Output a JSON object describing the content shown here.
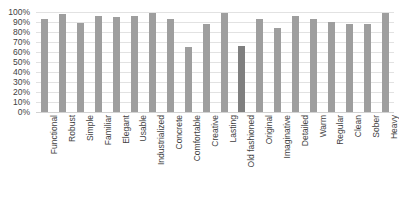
{
  "chart_data": {
    "type": "bar",
    "title": "",
    "xlabel": "",
    "ylabel": "",
    "ylim": [
      0,
      100
    ],
    "ytick_labels": [
      "100%",
      "90%",
      "80%",
      "70%",
      "60%",
      "50%",
      "40%",
      "30%",
      "20%",
      "10%",
      "0%"
    ],
    "ytick_values": [
      100,
      90,
      80,
      70,
      60,
      50,
      40,
      30,
      20,
      10,
      0
    ],
    "grid": true,
    "legend": "none",
    "bar_color": "#9e9e9e",
    "highlight_color": "#7f7f7f",
    "highlight_category": "Old fashioned",
    "categories": [
      "Functional",
      "Robust",
      "Simple",
      "Familiar",
      "Elegant",
      "Usable",
      "Industrialized",
      "Concrete",
      "Comfortable",
      "Creative",
      "Lasting",
      "Old fashioned",
      "Original",
      "Imaginative",
      "Detailed",
      "Warm",
      "Regular",
      "Clean",
      "Sober",
      "Heavy"
    ],
    "values": [
      93,
      98,
      89,
      96,
      95,
      96,
      99,
      93,
      65,
      88,
      99,
      66,
      93,
      84,
      96,
      93,
      90,
      88,
      88,
      99
    ]
  }
}
